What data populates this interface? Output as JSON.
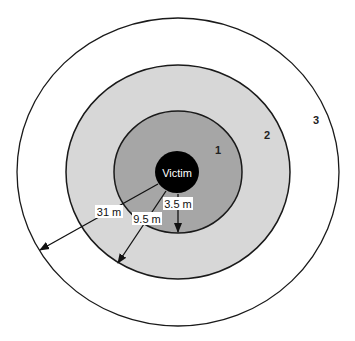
{
  "diagram": {
    "center_label": "Victim",
    "zones": [
      {
        "id": "1",
        "label": "1",
        "radius_label": "3.5 m",
        "fill": "#a6a6a6"
      },
      {
        "id": "2",
        "label": "2",
        "radius_label": "9.5 m",
        "fill": "#d7d7d7"
      },
      {
        "id": "3",
        "label": "3",
        "radius_label": "31 m",
        "fill": "#ffffff"
      }
    ],
    "colors": {
      "victim": "#000000",
      "stroke": "#1a1a1a",
      "label_bg": "#ffffff"
    }
  }
}
